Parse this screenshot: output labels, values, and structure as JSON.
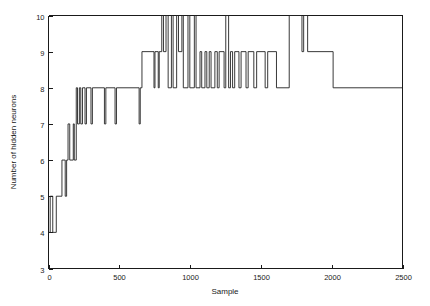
{
  "chart_data": {
    "type": "line",
    "title": "",
    "subtitle": "",
    "xlabel": "Sample",
    "ylabel": "Number of hidden neurons",
    "xlim": [
      0,
      2500
    ],
    "ylim": [
      3,
      10
    ],
    "xticks": [
      0,
      500,
      1000,
      1500,
      2000,
      2500
    ],
    "yticks": [
      3,
      4,
      5,
      6,
      7,
      8,
      9,
      10
    ],
    "xtick_labels": [
      "0",
      "500",
      "1000",
      "1500",
      "2000",
      "2500"
    ],
    "ytick_labels": [
      "3",
      "4",
      "5",
      "6",
      "7",
      "8",
      "9",
      "10"
    ],
    "grid": false,
    "legend": null,
    "legend_position": "none",
    "line_color": "#232323",
    "background_color": "#ffffff",
    "interpolation": "step-post",
    "series": [
      {
        "name": "hidden neurons",
        "x": [
          0,
          12,
          12,
          30,
          30,
          55,
          55,
          95,
          95,
          118,
          118,
          128,
          128,
          138,
          138,
          150,
          150,
          175,
          175,
          182,
          182,
          196,
          196,
          205,
          205,
          218,
          218,
          228,
          228,
          240,
          240,
          258,
          258,
          268,
          268,
          300,
          300,
          310,
          310,
          395,
          395,
          405,
          405,
          470,
          470,
          480,
          480,
          640,
          640,
          648,
          648,
          660,
          660,
          745,
          745,
          752,
          752,
          775,
          775,
          782,
          782,
          800,
          800,
          812,
          812,
          830,
          830,
          845,
          845,
          868,
          868,
          880,
          880,
          905,
          905,
          918,
          918,
          942,
          942,
          952,
          952,
          985,
          985,
          998,
          998,
          1030,
          1030,
          1042,
          1042,
          1070,
          1070,
          1082,
          1082,
          1105,
          1105,
          1118,
          1118,
          1135,
          1135,
          1148,
          1148,
          1175,
          1175,
          1192,
          1192,
          1205,
          1205,
          1240,
          1240,
          1252,
          1252,
          1272,
          1272,
          1285,
          1285,
          1300,
          1300,
          1315,
          1315,
          1345,
          1345,
          1360,
          1360,
          1395,
          1395,
          1410,
          1410,
          1450,
          1450,
          1470,
          1470,
          1530,
          1530,
          1548,
          1548,
          1610,
          1610,
          1700,
          1700,
          1790,
          1790,
          1802,
          1802,
          1830,
          1830,
          2010,
          2010,
          2500
        ],
        "y": [
          4,
          4,
          5,
          5,
          4,
          4,
          5,
          5,
          6,
          6,
          5,
          5,
          6,
          6,
          7,
          7,
          6,
          6,
          7,
          7,
          6,
          6,
          8,
          8,
          7,
          7,
          8,
          8,
          7,
          7,
          8,
          8,
          7,
          7,
          8,
          8,
          7,
          7,
          8,
          8,
          7,
          7,
          8,
          8,
          7,
          7,
          8,
          8,
          7,
          7,
          8,
          8,
          9,
          9,
          8,
          8,
          9,
          9,
          8,
          8,
          9,
          9,
          10,
          10,
          9,
          9,
          10,
          10,
          8,
          8,
          10,
          10,
          8,
          8,
          10,
          10,
          9,
          9,
          10,
          10,
          8,
          8,
          10,
          10,
          8,
          8,
          10,
          10,
          8,
          8,
          9,
          9,
          8,
          8,
          9,
          9,
          8,
          8,
          9,
          9,
          8,
          8,
          9,
          9,
          8,
          8,
          9,
          9,
          8,
          8,
          10,
          10,
          8,
          8,
          9,
          9,
          8,
          8,
          9,
          9,
          8,
          8,
          9,
          9,
          8,
          8,
          9,
          9,
          8,
          8,
          9,
          9,
          8,
          8,
          9,
          9,
          8,
          8,
          10,
          10,
          9,
          9,
          10,
          10,
          9,
          9,
          8,
          8
        ]
      }
    ]
  }
}
